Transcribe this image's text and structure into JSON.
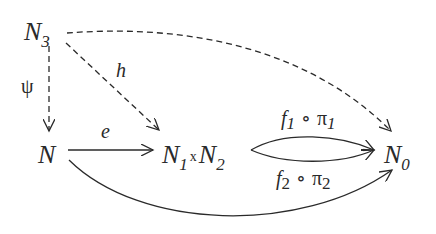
{
  "diagram": {
    "type": "commutative-diagram",
    "nodes": {
      "n3": {
        "base": "N",
        "sub": "3"
      },
      "n": {
        "base": "N"
      },
      "prod": {
        "left": "N",
        "left_sub": "1",
        "times": "x",
        "right": "N",
        "right_sub": "2"
      },
      "n0": {
        "base": "N",
        "sub": "0"
      }
    },
    "arrows": {
      "psi": {
        "label": "ψ",
        "from": "N3",
        "to": "N",
        "style": "dashed"
      },
      "h": {
        "label": "h",
        "from": "N3",
        "to": "N1xN2",
        "style": "dashed"
      },
      "top": {
        "label": "",
        "from": "N3",
        "to": "N0",
        "style": "dashed"
      },
      "e": {
        "label": "e",
        "from": "N",
        "to": "N1xN2",
        "style": "solid"
      },
      "f1": {
        "f": "f",
        "f_sub": "1",
        "circ": "∘",
        "pi": "π",
        "pi_sub": "1",
        "from": "N1xN2",
        "to": "N0",
        "style": "solid"
      },
      "f2": {
        "f": "f",
        "f_sub": "2",
        "circ": "∘",
        "pi": "π",
        "pi_sub": "2",
        "from": "N1xN2",
        "to": "N0",
        "style": "solid"
      },
      "bottom": {
        "label": "",
        "from": "N",
        "to": "N0",
        "style": "solid"
      }
    },
    "colors": {
      "ink": "#2a2a2a",
      "background": "#ffffff"
    }
  }
}
